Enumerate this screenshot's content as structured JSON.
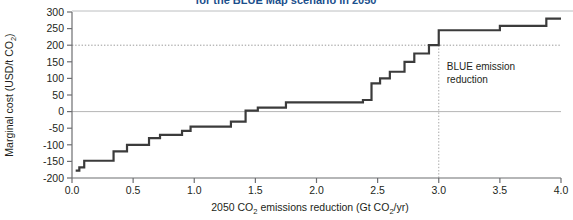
{
  "figure": {
    "title_fragment": "for the BLUE Map scenario in 2050",
    "background": "#ffffff",
    "line_color": "#3b3b3b",
    "axis_color": "#6d6e71",
    "grid_color": "#bcbec0"
  },
  "axes": {
    "y_title_main": "Marginal cost (USD/t CO",
    "y_title_sub": "2",
    "y_title_tail": ")",
    "x_title_a": "2050 CO",
    "x_title_sub1": "2",
    "x_title_b": " emissions reduction (Gt CO",
    "x_title_sub2": "2",
    "x_title_c": "/yr)"
  },
  "annotation": {
    "line1": "BLUE emission",
    "line2": "reduction",
    "marker_x": 3.0
  },
  "chart_data": {
    "type": "line",
    "subtype": "step-marginal-abatement-cost-curve",
    "title": "for the BLUE Map scenario in 2050",
    "xlabel": "2050 CO2 emissions reduction (Gt CO2/yr)",
    "ylabel": "Marginal cost (USD/t CO2)",
    "xlim": [
      0.0,
      4.0
    ],
    "ylim": [
      -200,
      300
    ],
    "xticks": [
      "0.0",
      "0.5",
      "1.0",
      "1.5",
      "2.0",
      "2.5",
      "3.0",
      "3.5",
      "4.0"
    ],
    "xtick_values": [
      0.0,
      0.5,
      1.0,
      1.5,
      2.0,
      2.5,
      3.0,
      3.5,
      4.0
    ],
    "yticks": [
      "300",
      "250",
      "200",
      "150",
      "100",
      "50",
      "0",
      "-50",
      "-100",
      "-150",
      "-200"
    ],
    "ytick_values": [
      300,
      250,
      200,
      150,
      100,
      50,
      0,
      -50,
      -100,
      -150,
      -200
    ],
    "grid": "horizontal reference lines at y=0 and y=200; dotted vertical line at x=3.0",
    "reference_lines": [
      {
        "axis": "y",
        "value": 0,
        "style": "solid-light"
      },
      {
        "axis": "y",
        "value": 200,
        "style": "dotted"
      },
      {
        "axis": "x",
        "value": 3.0,
        "style": "dotted"
      }
    ],
    "legend": "none",
    "annotations": [
      {
        "text": "BLUE emission reduction",
        "x": 3.05,
        "y": 120
      }
    ],
    "series": [
      {
        "name": "Marginal abatement cost",
        "steps": [
          {
            "x_start": 0.03,
            "x_end": 0.06,
            "cost": -178
          },
          {
            "x_start": 0.06,
            "x_end": 0.1,
            "cost": -168
          },
          {
            "x_start": 0.1,
            "x_end": 0.34,
            "cost": -148
          },
          {
            "x_start": 0.34,
            "x_end": 0.45,
            "cost": -120
          },
          {
            "x_start": 0.45,
            "x_end": 0.63,
            "cost": -100
          },
          {
            "x_start": 0.63,
            "x_end": 0.72,
            "cost": -80
          },
          {
            "x_start": 0.72,
            "x_end": 0.9,
            "cost": -70
          },
          {
            "x_start": 0.9,
            "x_end": 0.97,
            "cost": -58
          },
          {
            "x_start": 0.97,
            "x_end": 1.3,
            "cost": -45
          },
          {
            "x_start": 1.3,
            "x_end": 1.42,
            "cost": -30
          },
          {
            "x_start": 1.42,
            "x_end": 1.52,
            "cost": 3
          },
          {
            "x_start": 1.52,
            "x_end": 1.75,
            "cost": 12
          },
          {
            "x_start": 1.75,
            "x_end": 2.38,
            "cost": 28
          },
          {
            "x_start": 2.38,
            "x_end": 2.45,
            "cost": 35
          },
          {
            "x_start": 2.45,
            "x_end": 2.52,
            "cost": 85
          },
          {
            "x_start": 2.52,
            "x_end": 2.6,
            "cost": 100
          },
          {
            "x_start": 2.6,
            "x_end": 2.72,
            "cost": 120
          },
          {
            "x_start": 2.72,
            "x_end": 2.8,
            "cost": 150
          },
          {
            "x_start": 2.8,
            "x_end": 2.92,
            "cost": 175
          },
          {
            "x_start": 2.92,
            "x_end": 3.0,
            "cost": 200
          },
          {
            "x_start": 3.0,
            "x_end": 3.5,
            "cost": 245
          },
          {
            "x_start": 3.5,
            "x_end": 3.88,
            "cost": 258
          },
          {
            "x_start": 3.88,
            "x_end": 4.0,
            "cost": 280
          }
        ]
      }
    ]
  }
}
